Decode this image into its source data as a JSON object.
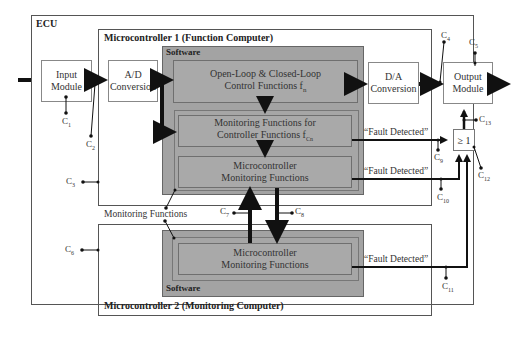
{
  "diagram": {
    "ecu": {
      "label": "ECU"
    },
    "mc1": {
      "label": "Microcontroller 1 (Function Computer)",
      "software_label": "Software",
      "blocks": {
        "control": {
          "line1": "Open-Loop & Closed-Loop",
          "line2": "Control Functions f",
          "sub": "n"
        },
        "monitor_ctrl": {
          "line1": "Monitoring Functions for",
          "line2": "Controller Functions f",
          "sub": "Cn"
        },
        "mc_monitor": {
          "line1": "Microcontroller",
          "line2": "Monitoring Functions"
        }
      }
    },
    "mc2": {
      "label": "Microcontroller 2 (Monitoring Computer)",
      "software_label": "Software",
      "blocks": {
        "mc_monitor": {
          "line1": "Microcontroller",
          "line2": "Monitoring Functions"
        }
      }
    },
    "input_module": {
      "line1": "Input",
      "line2": "Module"
    },
    "ad_conversion": {
      "line1": "A/D",
      "line2": "Conversion"
    },
    "da_conversion": {
      "line1": "D/A",
      "line2": "Conversion"
    },
    "output_module": {
      "line1": "Output",
      "line2": "Module"
    },
    "or_gate": {
      "label": "≥ 1"
    },
    "monitoring_functions_label": "Monitoring Functions",
    "fault_labels": [
      "“Fault Detected”",
      "“Fault Detected”",
      "“Fault Detected”"
    ],
    "connectors": [
      {
        "name": "C",
        "sub": "1"
      },
      {
        "name": "C",
        "sub": "2"
      },
      {
        "name": "C",
        "sub": "3"
      },
      {
        "name": "C",
        "sub": "4"
      },
      {
        "name": "C",
        "sub": "5"
      },
      {
        "name": "C",
        "sub": "6"
      },
      {
        "name": "C",
        "sub": "7"
      },
      {
        "name": "C",
        "sub": "8"
      },
      {
        "name": "C",
        "sub": "9"
      },
      {
        "name": "C",
        "sub": "10"
      },
      {
        "name": "C",
        "sub": "11"
      },
      {
        "name": "C",
        "sub": "12"
      },
      {
        "name": "C",
        "sub": "13"
      }
    ],
    "colors": {
      "software_fill": "#a3a3a3",
      "block_fill": "#a9a9a9",
      "line": "#111111",
      "frame": "#555555"
    }
  }
}
